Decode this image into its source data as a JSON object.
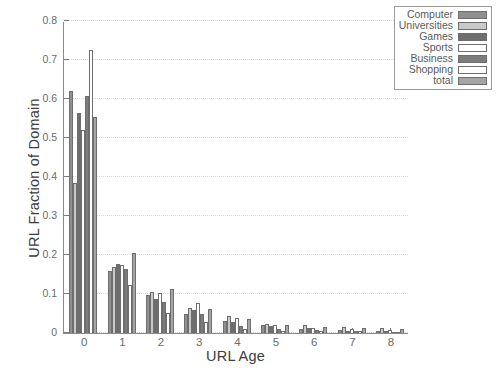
{
  "chart_data": {
    "type": "bar",
    "title": "",
    "xlabel": "URL Age",
    "ylabel": "URL Fraction of Domain",
    "categories": [
      "0",
      "1",
      "2",
      "3",
      "4",
      "5",
      "6",
      "7",
      "8"
    ],
    "ylim": [
      0,
      0.8
    ],
    "yticks": [
      "0",
      "0.1",
      "0.2",
      "0.3",
      "0.4",
      "0.5",
      "0.6",
      "0.7",
      "0.8"
    ],
    "ytick_values": [
      0,
      0.1,
      0.2,
      0.3,
      0.4,
      0.5,
      0.6,
      0.7,
      0.8
    ],
    "grid": true,
    "legend_position": "top-right",
    "series": [
      {
        "name": "Computer",
        "color": "#8f8f8f",
        "values": [
          0.62,
          0.16,
          0.097,
          0.05,
          0.032,
          0.02,
          0.01,
          0.009,
          0.006
        ]
      },
      {
        "name": "Universities",
        "color": "#c9c9c9",
        "values": [
          0.385,
          0.17,
          0.104,
          0.063,
          0.044,
          0.024,
          0.021,
          0.016,
          0.013
        ]
      },
      {
        "name": "Games",
        "color": "#6e6e6e",
        "values": [
          0.565,
          0.178,
          0.086,
          0.059,
          0.028,
          0.018,
          0.012,
          0.006,
          0.004
        ]
      },
      {
        "name": "Sports",
        "color": "#ffffff",
        "values": [
          0.52,
          0.175,
          0.102,
          0.077,
          0.038,
          0.02,
          0.014,
          0.01,
          0.007
        ]
      },
      {
        "name": "Business",
        "color": "#7d7d7d",
        "values": [
          0.608,
          0.165,
          0.079,
          0.049,
          0.017,
          0.01,
          0.008,
          0.005,
          0.003
        ]
      },
      {
        "name": "Shopping",
        "color": "#ffffff",
        "values": [
          0.725,
          0.122,
          0.052,
          0.029,
          0.011,
          0.006,
          0.005,
          0.004,
          0.002
        ]
      },
      {
        "name": "total",
        "color": "#a5a5a5",
        "values": [
          0.555,
          0.205,
          0.112,
          0.061,
          0.035,
          0.021,
          0.015,
          0.012,
          0.01
        ]
      }
    ]
  }
}
